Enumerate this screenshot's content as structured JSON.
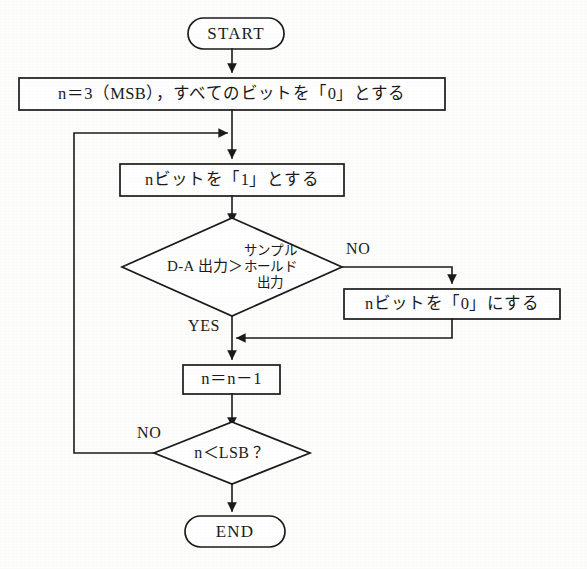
{
  "diagram": {
    "type": "flowchart",
    "orientation": "vertical",
    "stroke_color": "#1b1b1b",
    "fill_color": "#ffffff",
    "background_color": "#fdfdfc"
  },
  "nodes": {
    "start": {
      "shape": "terminator",
      "label": "START"
    },
    "init": {
      "shape": "process",
      "label": "n＝3（MSB），すべてのビットを「0」とする"
    },
    "set_bit_one": {
      "shape": "process",
      "label": "nビットを「1」とする"
    },
    "compare": {
      "shape": "decision",
      "label_left": "D-A 出力＞",
      "label_stack": [
        "サンプル",
        "ホールド",
        "出力"
      ]
    },
    "set_bit_zero": {
      "shape": "process",
      "label": "nビットを「0」にする"
    },
    "decrement": {
      "shape": "process",
      "label": "n＝n－1"
    },
    "check_lsb": {
      "shape": "decision",
      "label": "n＜LSB ？"
    },
    "end": {
      "shape": "terminator",
      "label": "END"
    }
  },
  "branch_labels": {
    "compare_no": "NO",
    "compare_yes": "YES",
    "lsb_no": "NO"
  },
  "edges": [
    {
      "from": "start",
      "to": "init",
      "label": ""
    },
    {
      "from": "init",
      "to": "set_bit_one",
      "label": ""
    },
    {
      "from": "set_bit_one",
      "to": "compare",
      "label": ""
    },
    {
      "from": "compare",
      "to": "set_bit_zero",
      "label": "NO"
    },
    {
      "from": "compare",
      "to": "decrement",
      "label": "YES"
    },
    {
      "from": "set_bit_zero",
      "to": "decrement",
      "label": ""
    },
    {
      "from": "decrement",
      "to": "check_lsb",
      "label": ""
    },
    {
      "from": "check_lsb",
      "to": "set_bit_one",
      "label": "NO"
    },
    {
      "from": "check_lsb",
      "to": "end",
      "label": ""
    }
  ]
}
